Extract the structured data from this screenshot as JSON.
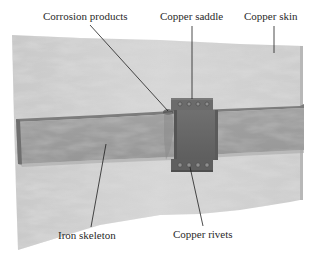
{
  "diagram": {
    "type": "labeled-illustration",
    "labels": [
      {
        "id": "corrosion",
        "text": "Corrosion products"
      },
      {
        "id": "saddle",
        "text": "Copper saddle"
      },
      {
        "id": "skin",
        "text": "Copper skin"
      },
      {
        "id": "skeleton",
        "text": "Iron skeleton"
      },
      {
        "id": "rivets",
        "text": "Copper rivets"
      }
    ],
    "colors": {
      "background": "#ffffff",
      "skin": "#cfcfcf",
      "skin_mottle": "#b5b5b5",
      "bar": "#9a9a9a",
      "bar_top": "#7e7e7e",
      "saddle": "#6a6a6a",
      "saddle_dark": "#4e4e4e",
      "rivet": "#8c8c8c",
      "leader": "#1e1e1e",
      "text": "#2a2a2a"
    }
  }
}
